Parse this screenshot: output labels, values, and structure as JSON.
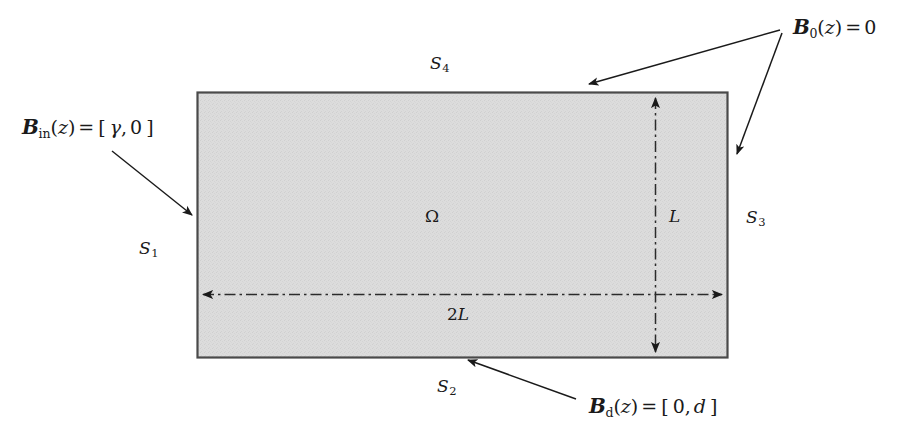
{
  "figure": {
    "domain_symbol": "Ω",
    "background_color": "#ffffff",
    "fill_color": "#d9d9d9",
    "stroke_color": "#404040"
  },
  "boundary_segments": [
    {
      "id": "s1",
      "letter": "S",
      "index": "1",
      "position": "left"
    },
    {
      "id": "s2",
      "letter": "S",
      "index": "2",
      "position": "bottom"
    },
    {
      "id": "s3",
      "letter": "S",
      "index": "3",
      "position": "right"
    },
    {
      "id": "s4",
      "letter": "S",
      "index": "4",
      "position": "top"
    }
  ],
  "dimensions": {
    "horizontal": {
      "value": "2",
      "symbol": "L",
      "full": "2L"
    },
    "vertical": {
      "value": "",
      "symbol": "L",
      "full": "L"
    }
  },
  "boundary_conditions": {
    "inflow": {
      "func": "B",
      "sub": "in",
      "arg": "z",
      "eq": "=",
      "open": "[",
      "v1": "γ",
      "comma": ",",
      "v2": "0",
      "close": "]"
    },
    "zero": {
      "func": "B",
      "sub": "0",
      "arg": "z",
      "eq": "=",
      "value": "0"
    },
    "dirichlet": {
      "func": "B",
      "sub": "d",
      "arg": "z",
      "eq": "=",
      "open": "[",
      "v1": "0",
      "comma": ",",
      "v2": "d",
      "close": "]"
    }
  }
}
